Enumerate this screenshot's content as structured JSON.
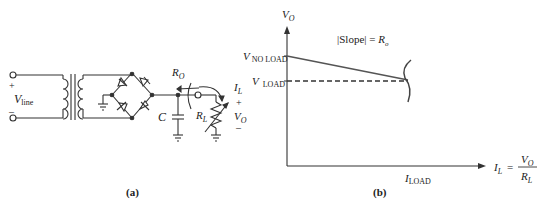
{
  "figure_a": {
    "caption": "(a)",
    "labels": {
      "plus_in": "+",
      "minus_in": "–",
      "vline_main": "V",
      "vline_sub": "line",
      "ro_main": "R",
      "ro_sub": "O",
      "c": "C",
      "rl_main": "R",
      "rl_sub": "L",
      "il_main": "I",
      "il_sub": "L",
      "plus_out": "+",
      "vo_main": "V",
      "vo_sub": "O",
      "minus_out": "–"
    }
  },
  "figure_b": {
    "caption": "(b)",
    "labels": {
      "y_axis_main": "V",
      "y_axis_sub": "O",
      "v_noload_main": "V",
      "v_noload_sub": "NO LOAD",
      "v_load_main": "V",
      "v_load_sub": "LOAD",
      "slope_text": "|Slope| = ",
      "slope_r": "R",
      "slope_r_sub": "o",
      "i_load_main": "I",
      "i_load_sub": "LOAD",
      "x_axis_lhs_main": "I",
      "x_axis_lhs_sub": "L",
      "x_axis_eq": "=",
      "x_axis_num_main": "V",
      "x_axis_num_sub": "O",
      "x_axis_den_main": "R",
      "x_axis_den_sub": "L"
    }
  },
  "colors": {
    "line": "#333333",
    "graph_line": "#555555"
  }
}
